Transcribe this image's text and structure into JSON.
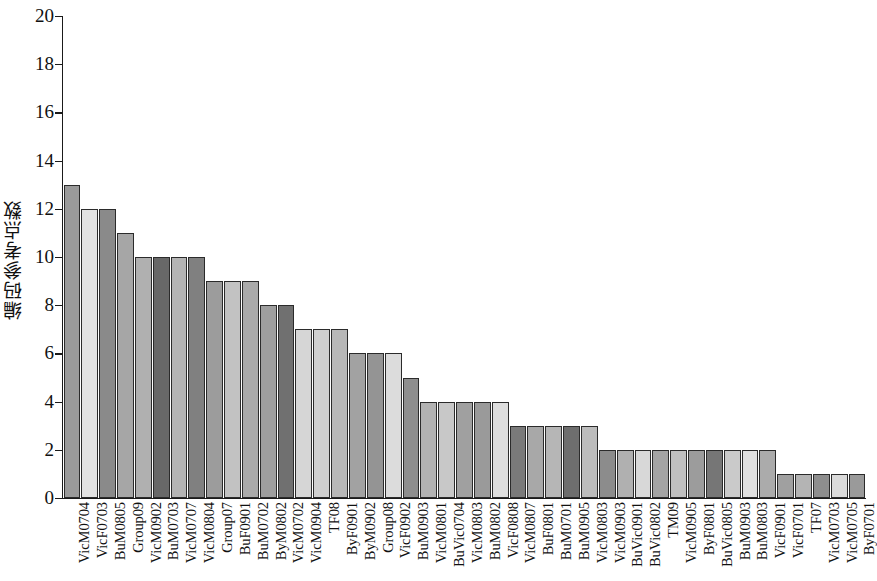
{
  "chart_data": {
    "type": "bar",
    "title": "",
    "xlabel": "",
    "ylabel": "编码参考点数",
    "ylim": [
      0,
      20
    ],
    "yticks": [
      0,
      2,
      4,
      6,
      8,
      10,
      12,
      14,
      16,
      18,
      20
    ],
    "grid": false,
    "legend": null,
    "categories": [
      "VicM0704",
      "VicF0703",
      "BuM0805",
      "Group09",
      "VicM0902",
      "BuM0703",
      "VicM0707",
      "VicM0804",
      "Group07",
      "BuF0901",
      "BuM0702",
      "ByM0802",
      "VicM0702",
      "VicM0904",
      "TF08",
      "ByF0901",
      "ByM0902",
      "Group08",
      "VicF0902",
      "BuM0903",
      "VicM0801",
      "BuVic0704",
      "VicM0803",
      "BuM0802",
      "VicF0808",
      "VicM0807",
      "BuF0801",
      "BuM0701",
      "BuM0905",
      "VicM0803",
      "VicM0903",
      "BuVic0901",
      "BuVic0802",
      "TM09",
      "VicM0905",
      "ByF0801",
      "BuVic0805",
      "BuM0903",
      "BuM0803",
      "VicF0901",
      "VicF0701",
      "TF07",
      "VicM0703",
      "VicM0705",
      "ByF0701"
    ],
    "values": [
      13,
      12,
      12,
      11,
      10,
      10,
      10,
      10,
      9,
      9,
      9,
      8,
      8,
      7,
      7,
      7,
      6,
      6,
      6,
      5,
      4,
      4,
      4,
      4,
      4,
      3,
      3,
      3,
      3,
      3,
      2,
      2,
      2,
      2,
      2,
      2,
      2,
      2,
      2,
      2,
      1,
      1,
      1,
      1,
      1
    ],
    "bar_colors": [
      "#9a9a9a",
      "#e2e2e2",
      "#8a8a8a",
      "#a6a6a6",
      "#b0b0b0",
      "#686868",
      "#b4b4b4",
      "#808080",
      "#9c9c9c",
      "#c2c2c2",
      "#aaaaaa",
      "#9e9e9e",
      "#707070",
      "#d6d6d6",
      "#cfcfcf",
      "#b8b8b8",
      "#a2a2a2",
      "#949494",
      "#dcdcdc",
      "#8e8e8e",
      "#b2b2b2",
      "#c8c8c8",
      "#a0a0a0",
      "#9a9a9a",
      "#dedede",
      "#7a7a7a",
      "#a8a8a8",
      "#b6b6b6",
      "#6e6e6e",
      "#bcbcbc",
      "#8c8c8c",
      "#b0b0b0",
      "#d8d8d8",
      "#a4a4a4",
      "#c0c0c0",
      "#9c9c9c",
      "#767676",
      "#cacaca",
      "#e0e0e0",
      "#ababab",
      "#a0a0a0",
      "#b4b4b4",
      "#8e8e8e",
      "#dadada",
      "#9a9a9a"
    ]
  },
  "axis": {
    "y_title": "编码参考点数",
    "y_max_label": "20",
    "y_min_label": "0"
  }
}
